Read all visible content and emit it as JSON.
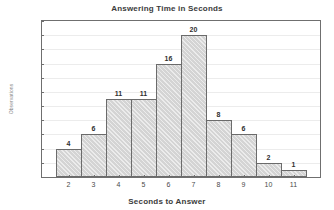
{
  "chart_data": {
    "type": "bar",
    "title": "Answering Time in Seconds",
    "xlabel": "Seconds to Answer",
    "ylabel": "Observations",
    "categories": [
      "2",
      "3",
      "4",
      "5",
      "6",
      "7",
      "8",
      "9",
      "10",
      "11"
    ],
    "values": [
      4,
      6,
      11,
      11,
      16,
      20,
      8,
      6,
      2,
      1
    ],
    "value_labels": [
      "4",
      "6",
      "11",
      "11",
      "16",
      "20",
      "8",
      "6",
      "2",
      "1"
    ],
    "ylim": [
      0,
      22
    ],
    "ytick_labels": [
      "0",
      "2",
      "4",
      "6",
      "8",
      "10",
      "12",
      "14",
      "16",
      "18",
      "20",
      "22"
    ],
    "ytick_values": [
      0,
      2,
      4,
      6,
      8,
      10,
      12,
      14,
      16,
      18,
      20,
      22
    ],
    "grid": "horizontal",
    "legend": "none",
    "colors": {
      "bar_fill": "#d4d4d4",
      "bar_edge": "#6b6b6b",
      "grid": "#ececec",
      "frame": "#6f6f6f",
      "text": "#3b3b3b",
      "background": "#ffffff"
    }
  }
}
